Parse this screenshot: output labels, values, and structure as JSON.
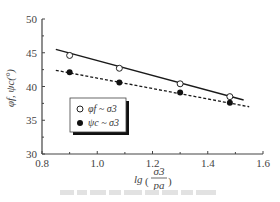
{
  "chart_data": {
    "type": "line",
    "title": "",
    "xlabel": "lg(σ3/pa)",
    "xlabel_parts": {
      "prefix": "lg",
      "numerator": "σ3",
      "denominator": "pa"
    },
    "ylabel": "φf, ψc(°)",
    "xlim": [
      0.8,
      1.6
    ],
    "ylim": [
      30,
      50
    ],
    "xticks": [
      0.8,
      1.0,
      1.2,
      1.4,
      1.6
    ],
    "xtick_labels": [
      "0.8",
      "1.0",
      "1.2",
      "1.4",
      "1.6"
    ],
    "yticks": [
      30,
      35,
      40,
      45,
      50
    ],
    "ytick_labels": [
      "30",
      "35",
      "40",
      "45",
      "50"
    ],
    "grid": false,
    "legend_position": "lower-left inside plot",
    "series": [
      {
        "name": "φf ~ σ3",
        "marker": "open-circle",
        "line": "solid",
        "x": [
          0.9,
          1.08,
          1.3,
          1.48
        ],
        "y": [
          44.6,
          42.7,
          40.4,
          38.5
        ],
        "fit_line": {
          "x": [
            0.85,
            1.53
          ],
          "y": [
            45.5,
            38.0
          ]
        }
      },
      {
        "name": "ψc ~ σ3",
        "marker": "filled-circle",
        "line": "dashed",
        "x": [
          0.9,
          1.08,
          1.3,
          1.48
        ],
        "y": [
          42.1,
          40.6,
          39.1,
          37.6
        ],
        "fit_line": {
          "x": [
            0.85,
            1.55
          ],
          "y": [
            42.4,
            37.0
          ]
        }
      }
    ]
  },
  "legend": {
    "items": [
      {
        "label": "φf ~ σ3",
        "symbol": "○"
      },
      {
        "label": "ψc ~ σ3",
        "symbol": "●"
      }
    ]
  },
  "colors": {
    "axis": "#444444",
    "line": "#1a1a1a",
    "background": "#ffffff"
  }
}
